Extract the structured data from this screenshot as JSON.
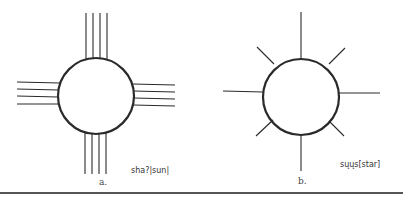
{
  "figures": [
    {
      "id": "a",
      "sublabel": "a.",
      "caption": "sha?|sun|",
      "symbol": "sun"
    },
    {
      "id": "b",
      "sublabel": "b.",
      "caption": "sųųs[star]",
      "symbol": "star"
    }
  ],
  "colors": {
    "stroke": "#2a2a2a",
    "background": "#ffffff"
  }
}
